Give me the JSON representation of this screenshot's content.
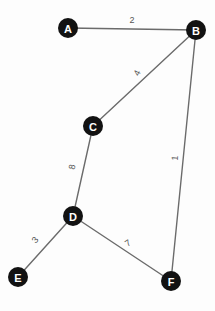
{
  "diagram": {
    "background_color": "#fdfdfd",
    "node_fill_color": "#121212",
    "node_text_color": "#ffffff",
    "edge_color": "#6b6b6b",
    "weight_text_color": "#555555"
  },
  "chart_data": {
    "type": "graph",
    "directed": false,
    "weighted": true,
    "nodes": [
      {
        "id": "A",
        "label": "A",
        "x": 68,
        "y": 28,
        "r": 10
      },
      {
        "id": "B",
        "label": "B",
        "x": 196,
        "y": 30,
        "r": 10
      },
      {
        "id": "C",
        "label": "C",
        "x": 93,
        "y": 126,
        "r": 10
      },
      {
        "id": "D",
        "label": "D",
        "x": 73,
        "y": 216,
        "r": 10
      },
      {
        "id": "E",
        "label": "E",
        "x": 18,
        "y": 277,
        "r": 10
      },
      {
        "id": "F",
        "label": "F",
        "x": 171,
        "y": 281,
        "r": 10
      }
    ],
    "edges": [
      {
        "source": "A",
        "target": "B",
        "weight": "2",
        "lx": 132,
        "ly": 20,
        "rot": 0
      },
      {
        "source": "B",
        "target": "C",
        "weight": "4",
        "lx": 137,
        "ly": 73,
        "rot": -65
      },
      {
        "source": "C",
        "target": "D",
        "weight": "8",
        "lx": 72,
        "ly": 167,
        "rot": -78
      },
      {
        "source": "D",
        "target": "E",
        "weight": "3",
        "lx": 35,
        "ly": 240,
        "rot": -50
      },
      {
        "source": "D",
        "target": "F",
        "weight": "7",
        "lx": 128,
        "ly": 243,
        "rot": -34
      },
      {
        "source": "B",
        "target": "F",
        "weight": "1",
        "lx": 175,
        "ly": 158,
        "rot": -87
      }
    ]
  }
}
